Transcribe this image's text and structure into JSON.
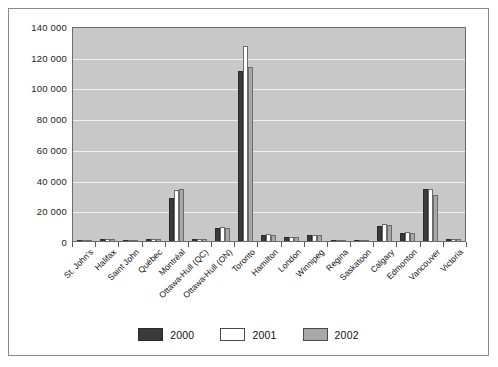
{
  "chart_data": {
    "type": "bar",
    "title": "",
    "xlabel": "",
    "ylabel": "",
    "ylim": [
      0,
      140000
    ],
    "grid": true,
    "legend_position": "bottom-center",
    "ytick_labels": [
      "140 000",
      "120 000",
      "100 000",
      "80 000",
      "60 000",
      "40 000",
      "20 000",
      "0"
    ],
    "ytick_values": [
      140000,
      120000,
      100000,
      80000,
      60000,
      40000,
      20000,
      0
    ],
    "categories": [
      "St. John's",
      "Halifax",
      "Saint John",
      "Québec",
      "Montréal",
      "Ottawa-Hull (QC)",
      "Ottawa-Hull (ON)",
      "Toronto",
      "Hamilton",
      "London",
      "Winnipeg",
      "Regina",
      "Saskatoon",
      "Calgary",
      "Edmonton",
      "Vancouver",
      "Victoria"
    ],
    "series": [
      {
        "name": "2000",
        "color": "#3a3a3a",
        "values": [
          400,
          1600,
          400,
          1400,
          28000,
          1400,
          8200,
          111000,
          4200,
          2800,
          3800,
          900,
          900,
          9800,
          5200,
          34000,
          1400
        ]
      },
      {
        "name": "2001",
        "color": "#ffffff",
        "values": [
          400,
          1500,
          400,
          1600,
          33000,
          1300,
          9000,
          127000,
          4500,
          2900,
          4200,
          800,
          900,
          10800,
          5600,
          34000,
          1400
        ]
      },
      {
        "name": "2002",
        "color": "#a8a8a8",
        "values": [
          400,
          1400,
          400,
          1300,
          34000,
          1200,
          8200,
          113000,
          4000,
          2600,
          3900,
          800,
          800,
          10200,
          5000,
          30000,
          1300
        ]
      }
    ]
  },
  "legend": {
    "items": [
      {
        "label": "2000",
        "key": "s2000"
      },
      {
        "label": "2001",
        "key": "s2001"
      },
      {
        "label": "2002",
        "key": "s2002"
      }
    ]
  }
}
